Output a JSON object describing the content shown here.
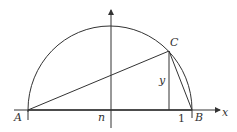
{
  "diagram": {
    "type": "geometry",
    "colors": {
      "stroke": "#333333",
      "background": "#ffffff"
    },
    "labels": {
      "A": "A",
      "B": "B",
      "C": "C",
      "y": "y",
      "n": "n",
      "one": "1",
      "x_axis": "x"
    },
    "points": {
      "A": [
        28,
        110
      ],
      "B": [
        192,
        110
      ],
      "C": [
        169,
        51
      ],
      "foot": [
        169,
        110
      ],
      "origin": [
        111,
        110
      ]
    },
    "semicircle": {
      "center": [
        110,
        110
      ],
      "radius": 82
    },
    "axes": {
      "x": {
        "from": [
          14,
          110
        ],
        "to": [
          222,
          110
        ]
      },
      "y": {
        "from": [
          111,
          128
        ],
        "to": [
          111,
          8
        ]
      }
    }
  }
}
